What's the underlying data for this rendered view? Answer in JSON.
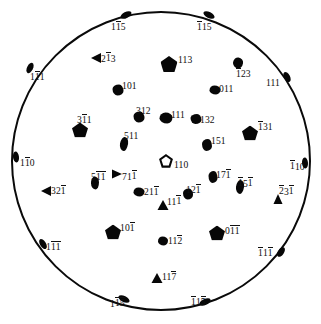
{
  "figure": {
    "kind": "stereographic-projection",
    "title": "",
    "line_color": "#0a0a0a",
    "marker_color": "#070707",
    "background": "#ffffff",
    "circle": {
      "cx": 160.5,
      "cy": 161.0,
      "r": 150.0
    }
  },
  "poles": [
    {
      "id": "p01",
      "label": "115",
      "bars": [
        1
      ],
      "x": 126.0,
      "y": 15.0,
      "marker": "edge",
      "mw": 12,
      "mh": 6,
      "rot": -28,
      "lx": 111.0,
      "ly": 21.0
    },
    {
      "id": "p02",
      "label": "115",
      "bars": [
        0
      ],
      "x": 209.0,
      "y": 15.0,
      "marker": "edge",
      "mw": 12,
      "mh": 6,
      "rot": 26,
      "lx": 197.0,
      "ly": 21.0
    },
    {
      "id": "p03",
      "label": "213",
      "bars": [
        1
      ],
      "x": 96.0,
      "y": 58.0,
      "marker": "tri-l",
      "mw": 10,
      "mh": 10,
      "rot": 0,
      "lx": 101.0,
      "ly": 52.5
    },
    {
      "id": "p04",
      "label": "113",
      "bars": [],
      "x": 169.0,
      "y": 64.0,
      "marker": "pent",
      "mw": 17,
      "mh": 16,
      "rot": 0,
      "lx": 178.0,
      "ly": 55.0
    },
    {
      "id": "p05",
      "label": "123",
      "bars": [
        0
      ],
      "x": 238.0,
      "y": 63.0,
      "marker": "blob",
      "mw": 10,
      "mh": 11,
      "rot": 10,
      "lx": 236.0,
      "ly": 68.0
    },
    {
      "id": "p06",
      "label": "111",
      "bars": [
        1
      ],
      "x": 30.0,
      "y": 68.0,
      "marker": "edge",
      "mw": 11,
      "mh": 6,
      "rot": -64,
      "lx": 30.0,
      "ly": 71.0
    },
    {
      "id": "p07",
      "label": "101",
      "bars": [],
      "x": 118.0,
      "y": 90.0,
      "marker": "blob2",
      "mw": 11,
      "mh": 11,
      "rot": 0,
      "lx": 122.0,
      "ly": 80.5
    },
    {
      "id": "p08",
      "label": "011",
      "bars": [],
      "x": 215.0,
      "y": 90.0,
      "marker": "blob",
      "mw": 11,
      "mh": 9,
      "rot": 0,
      "lx": 219.0,
      "ly": 84.0
    },
    {
      "id": "p09",
      "label": "111",
      "bars": [],
      "x": 287.0,
      "y": 77.0,
      "marker": "edge",
      "mw": 11,
      "mh": 6,
      "rot": 62,
      "lx": 266.0,
      "ly": 78.0
    },
    {
      "id": "p10",
      "label": "312",
      "bars": [],
      "x": 139.0,
      "y": 117.0,
      "marker": "blob2",
      "mw": 11,
      "mh": 11,
      "rot": 0,
      "lx": 136.0,
      "ly": 106.0
    },
    {
      "id": "p11",
      "label": "111",
      "bars": [],
      "x": 166.0,
      "y": 118.0,
      "marker": "blob",
      "mw": 13,
      "mh": 11,
      "rot": 0,
      "lx": 171.0,
      "ly": 109.5
    },
    {
      "id": "p12",
      "label": "132",
      "bars": [],
      "x": 196.0,
      "y": 119.0,
      "marker": "blob2",
      "mw": 11,
      "mh": 10,
      "rot": 0,
      "lx": 200.0,
      "ly": 114.5
    },
    {
      "id": "p13",
      "label": "311",
      "bars": [
        1
      ],
      "x": 80.0,
      "y": 130.0,
      "marker": "pent",
      "mw": 16,
      "mh": 15,
      "rot": 0,
      "lx": 77.0,
      "ly": 114.0
    },
    {
      "id": "p14",
      "label": "131",
      "bars": [
        0
      ],
      "x": 250.0,
      "y": 133.0,
      "marker": "pent",
      "mw": 16,
      "mh": 15,
      "rot": 0,
      "lx": 258.0,
      "ly": 121.0
    },
    {
      "id": "p15",
      "label": "511",
      "bars": [],
      "x": 124.0,
      "y": 144.0,
      "marker": "blob",
      "mw": 8,
      "mh": 14,
      "rot": 10,
      "lx": 124.0,
      "ly": 130.5
    },
    {
      "id": "p16",
      "label": "151",
      "bars": [],
      "x": 207.0,
      "y": 145.0,
      "marker": "blob2",
      "mw": 10,
      "mh": 12,
      "rot": 0,
      "lx": 211.0,
      "ly": 136.0
    },
    {
      "id": "p17",
      "label": "110",
      "bars": [
        1
      ],
      "x": 16.0,
      "y": 157.0,
      "marker": "edge",
      "mw": 11,
      "mh": 6,
      "rot": 84,
      "lx": 20.0,
      "ly": 157.0
    },
    {
      "id": "p18",
      "label": "110",
      "bars": [
        0
      ],
      "x": 305.0,
      "y": 163.0,
      "marker": "edge",
      "mw": 11,
      "mh": 6,
      "rot": 86,
      "lx": 290.0,
      "ly": 160.5
    },
    {
      "id": "p19",
      "label": "110",
      "bars": [],
      "x": 166.0,
      "y": 161.0,
      "marker": "pent-open",
      "mw": 12,
      "mh": 12,
      "rot": 0,
      "lx": 174.0,
      "ly": 160.0
    },
    {
      "id": "p20",
      "label": "511",
      "bars": [
        1,
        2
      ],
      "x": 95.0,
      "y": 183.0,
      "marker": "blob",
      "mw": 8,
      "mh": 13,
      "rot": 0,
      "lx": 91.0,
      "ly": 171.0
    },
    {
      "id": "p21",
      "label": "711",
      "bars": [
        2
      ],
      "x": 117.0,
      "y": 174.0,
      "marker": "tri-r",
      "mw": 10,
      "mh": 9,
      "rot": 0,
      "lx": 122.0,
      "ly": 170.5
    },
    {
      "id": "p22",
      "label": "171",
      "bars": [
        2
      ],
      "x": 213.0,
      "y": 177.0,
      "marker": "blob2",
      "mw": 9,
      "mh": 12,
      "rot": 0,
      "lx": 216.0,
      "ly": 169.0
    },
    {
      "id": "p23",
      "label": "151",
      "bars": [
        0,
        2
      ],
      "x": 240.0,
      "y": 187.0,
      "marker": "blob",
      "mw": 8,
      "mh": 14,
      "rot": 8,
      "lx": 238.0,
      "ly": 177.5
    },
    {
      "id": "p24",
      "label": "321",
      "bars": [
        2
      ],
      "x": 46.0,
      "y": 191.0,
      "marker": "tri-l",
      "mw": 10,
      "mh": 10,
      "rot": 0,
      "lx": 51.0,
      "ly": 185.0
    },
    {
      "id": "p25",
      "label": "231",
      "bars": [
        0,
        2
      ],
      "x": 278.0,
      "y": 199.0,
      "marker": "tri-u",
      "mw": 9,
      "mh": 10,
      "rot": 0,
      "lx": 279.0,
      "ly": 185.5
    },
    {
      "id": "p26",
      "label": "211",
      "bars": [
        2
      ],
      "x": 139.0,
      "y": 192.0,
      "marker": "blob",
      "mw": 11,
      "mh": 9,
      "rot": 0,
      "lx": 144.0,
      "ly": 186.0
    },
    {
      "id": "p27",
      "label": "121",
      "bars": [
        2
      ],
      "x": 188.0,
      "y": 194.0,
      "marker": "blob2",
      "mw": 10,
      "mh": 11,
      "rot": 0,
      "lx": 186.0,
      "ly": 184.0
    },
    {
      "id": "p28",
      "label": "111",
      "bars": [
        2
      ],
      "x": 163.0,
      "y": 205.0,
      "marker": "tri-u",
      "mw": 11,
      "mh": 10,
      "rot": 0,
      "lx": 167.0,
      "ly": 195.5
    },
    {
      "id": "p29",
      "label": "101",
      "bars": [
        2
      ],
      "x": 113.0,
      "y": 232.0,
      "marker": "pent",
      "mw": 16,
      "mh": 15,
      "rot": 0,
      "lx": 120.0,
      "ly": 222.0
    },
    {
      "id": "p30",
      "label": "011",
      "bars": [
        1,
        2
      ],
      "x": 217.0,
      "y": 233.0,
      "marker": "pent",
      "mw": 16,
      "mh": 15,
      "rot": 0,
      "lx": 225.0,
      "ly": 225.0
    },
    {
      "id": "p31",
      "label": "112",
      "bars": [
        2
      ],
      "x": 163.0,
      "y": 241.0,
      "marker": "blob",
      "mw": 10,
      "mh": 9,
      "rot": 0,
      "lx": 168.0,
      "ly": 235.0
    },
    {
      "id": "p32",
      "label": "111",
      "bars": [
        1,
        2
      ],
      "x": 43.0,
      "y": 244.0,
      "marker": "edge",
      "mw": 11,
      "mh": 6,
      "rot": 58,
      "lx": 46.0,
      "ly": 241.0
    },
    {
      "id": "p33",
      "label": "111",
      "bars": [
        0,
        2
      ],
      "x": 281.0,
      "y": 252.0,
      "marker": "edge",
      "mw": 11,
      "mh": 6,
      "rot": -56,
      "lx": 258.0,
      "ly": 247.0
    },
    {
      "id": "p34",
      "label": "117",
      "bars": [
        2
      ],
      "x": 157.0,
      "y": 278.0,
      "marker": "tri-u",
      "mw": 11,
      "mh": 10,
      "rot": 0,
      "lx": 162.0,
      "ly": 271.0
    },
    {
      "id": "p35",
      "label": "115",
      "bars": [
        1,
        2
      ],
      "x": 124.0,
      "y": 299.0,
      "marker": "edge",
      "mw": 12,
      "mh": 6,
      "rot": 26,
      "lx": 110.0,
      "ly": 297.5
    },
    {
      "id": "p36",
      "label": "115",
      "bars": [
        0,
        2
      ],
      "x": 205.0,
      "y": 302.0,
      "marker": "edge",
      "mw": 12,
      "mh": 6,
      "rot": -24,
      "lx": 191.0,
      "ly": 296.0
    }
  ]
}
